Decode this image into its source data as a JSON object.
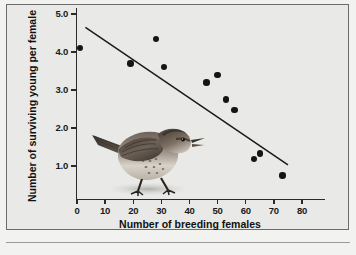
{
  "figure": {
    "background_color": "#e9e9e7",
    "border_color": "#6b6b6b",
    "inset_image_name": "song-sparrow-photo",
    "inset_description": "Photograph of a song sparrow perched on the ground"
  },
  "chart_data": {
    "type": "scatter",
    "title": "",
    "xlabel": "Number of breeding females",
    "ylabel": "Number of surviving young per female",
    "xlim": [
      0,
      85
    ],
    "ylim": [
      0.35,
      5.3
    ],
    "xticks": [
      0,
      10,
      20,
      30,
      40,
      50,
      60,
      70,
      80
    ],
    "xtick_labels": [
      "0",
      "10",
      "20",
      "30",
      "40",
      "50",
      "60",
      "70",
      "80"
    ],
    "yticks": [
      1.0,
      2.0,
      3.0,
      4.0,
      5.0
    ],
    "ytick_labels": [
      "1.0",
      "2.0",
      "3.0",
      "4.0",
      "5.0"
    ],
    "grid": false,
    "legend": false,
    "point_color": "#151515",
    "line_color": "#1a1a1a",
    "points": [
      {
        "x": 1,
        "y": 4.1
      },
      {
        "x": 19,
        "y": 3.7
      },
      {
        "x": 28,
        "y": 4.35
      },
      {
        "x": 31,
        "y": 3.6
      },
      {
        "x": 46,
        "y": 3.2
      },
      {
        "x": 50,
        "y": 3.4
      },
      {
        "x": 53,
        "y": 2.75
      },
      {
        "x": 56,
        "y": 2.48
      },
      {
        "x": 63,
        "y": 1.18
      },
      {
        "x": 65,
        "y": 1.33
      },
      {
        "x": 73,
        "y": 0.75
      }
    ],
    "trend_line": {
      "type": "linear-regression",
      "x_start": 3,
      "y_start": 4.65,
      "x_end": 75,
      "y_end": 1.03
    }
  }
}
